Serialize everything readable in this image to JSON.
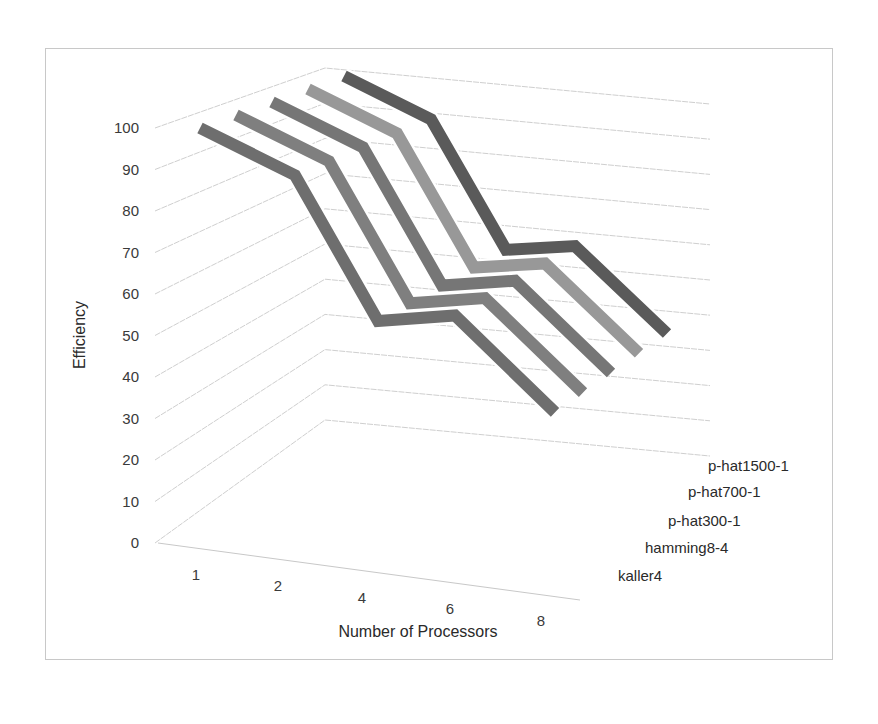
{
  "chart_data": {
    "type": "line",
    "subtype": "3d-line",
    "title": "",
    "xlabel": "Number of Processors",
    "ylabel": "Efficiency",
    "categories": [
      "1",
      "2",
      "4",
      "6",
      "8"
    ],
    "yticks": [
      "0",
      "10",
      "20",
      "30",
      "40",
      "50",
      "60",
      "70",
      "80",
      "90",
      "100"
    ],
    "ylim": [
      0,
      100
    ],
    "grid": true,
    "legend_position": "right (series depth axis labels)",
    "series": [
      {
        "name": "kaller4",
        "values": [
          100,
          92,
          60,
          64,
          44
        ],
        "color": "#6e6e6e"
      },
      {
        "name": "hamming8-4",
        "values": [
          100,
          92,
          60,
          64,
          44
        ],
        "color": "#7f7f7f"
      },
      {
        "name": "p-hat300-1",
        "values": [
          100,
          92,
          60,
          64,
          44
        ],
        "color": "#767676"
      },
      {
        "name": "p-hat700-1",
        "values": [
          100,
          92,
          60,
          64,
          44
        ],
        "color": "#989898"
      },
      {
        "name": "p-hat1500-1",
        "values": [
          100,
          92,
          60,
          64,
          44
        ],
        "color": "#5a5a5a"
      }
    ]
  }
}
